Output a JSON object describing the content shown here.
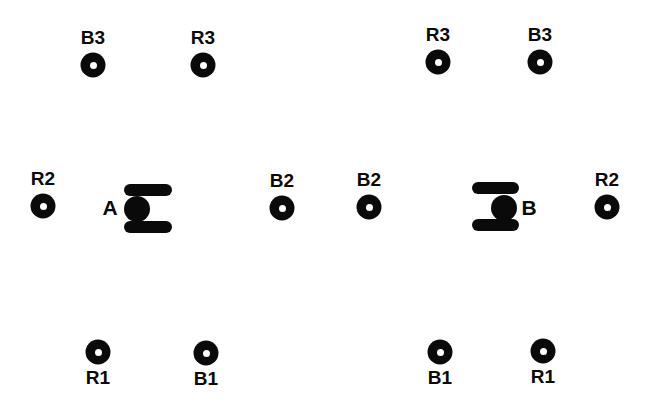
{
  "figure": {
    "width": 646,
    "height": 416,
    "background": "#ffffff",
    "ink": "#0a0a0a"
  },
  "sources": [
    {
      "label": "A",
      "x": 137,
      "y": 209,
      "dot_diameter": 26,
      "label_dx": -27,
      "label_dy": -2,
      "bar_dx": -13,
      "bar_width": 48,
      "bar_height": 12,
      "top_bar_dy": -25,
      "bottom_bar_dy": 12
    },
    {
      "label": "B",
      "x": 504,
      "y": 208,
      "dot_diameter": 26,
      "label_dx": 25,
      "label_dy": -1,
      "bar_dx": -32,
      "bar_width": 47,
      "bar_height": 12,
      "top_bar_dy": -26,
      "bottom_bar_dy": 11
    }
  ],
  "receivers": [
    {
      "label": "B3",
      "x": 93,
      "y": 65,
      "label_position": "above"
    },
    {
      "label": "R3",
      "x": 203,
      "y": 65,
      "label_position": "above"
    },
    {
      "label": "R3",
      "x": 438,
      "y": 62,
      "label_position": "above"
    },
    {
      "label": "B3",
      "x": 540,
      "y": 62,
      "label_position": "above"
    },
    {
      "label": "R2",
      "x": 43,
      "y": 206,
      "label_position": "above"
    },
    {
      "label": "B2",
      "x": 282,
      "y": 208,
      "label_position": "above"
    },
    {
      "label": "B2",
      "x": 369,
      "y": 207,
      "label_position": "above"
    },
    {
      "label": "R2",
      "x": 607,
      "y": 207,
      "label_position": "above"
    },
    {
      "label": "R1",
      "x": 98,
      "y": 352,
      "label_position": "below"
    },
    {
      "label": "B1",
      "x": 206,
      "y": 353,
      "label_position": "below"
    },
    {
      "label": "B1",
      "x": 440,
      "y": 352,
      "label_position": "below"
    },
    {
      "label": "R1",
      "x": 543,
      "y": 351,
      "label_position": "below"
    }
  ]
}
